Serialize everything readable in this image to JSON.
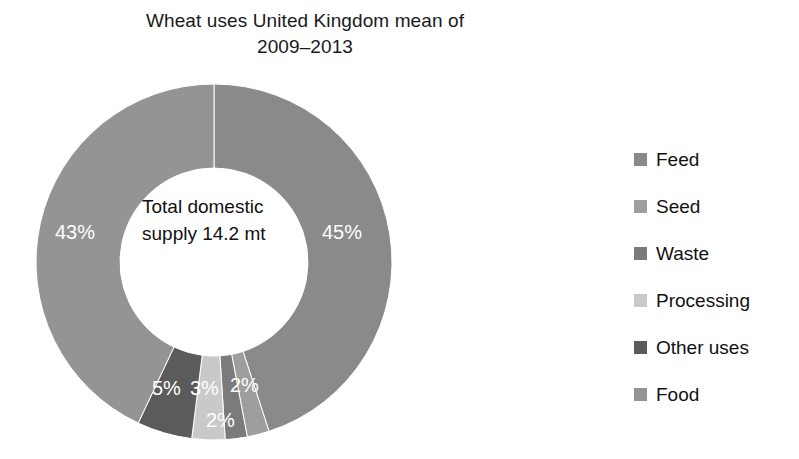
{
  "chart_data": {
    "type": "pie",
    "variant": "donut",
    "title": "Wheat uses United Kingdom mean of\n2009–2013",
    "xlabel": "",
    "ylabel": "",
    "center_label": "Total domestic supply 14.2 mt",
    "units": "percent",
    "total_label": "Total domestic supply 14.2 mt",
    "total_value": 14.2,
    "total_units": "mt",
    "legend_position": "right",
    "grid": false,
    "start_angle_deg": 0,
    "direction": "clockwise",
    "categories": [
      "Feed",
      "Seed",
      "Waste",
      "Processing",
      "Other uses",
      "Food"
    ],
    "values": [
      45,
      2,
      2,
      3,
      5,
      43
    ],
    "data_labels": [
      "45%",
      "2%",
      "2%",
      "3%",
      "5%",
      "43%"
    ],
    "colors": [
      "#8a8a8a",
      "#9e9e9e",
      "#7b7b7b",
      "#c9c9c9",
      "#5b5b5b",
      "#949494"
    ],
    "slices": [
      {
        "name": "Feed",
        "value": 45,
        "label": "45%",
        "color": "#8a8a8a"
      },
      {
        "name": "Seed",
        "value": 2,
        "label": "2%",
        "color": "#9e9e9e"
      },
      {
        "name": "Waste",
        "value": 2,
        "label": "2%",
        "color": "#7b7b7b"
      },
      {
        "name": "Processing",
        "value": 3,
        "label": "3%",
        "color": "#c9c9c9"
      },
      {
        "name": "Other uses",
        "value": 5,
        "label": "5%",
        "color": "#5b5b5b"
      },
      {
        "name": "Food",
        "value": 43,
        "label": "43%",
        "color": "#949494"
      }
    ]
  },
  "legend": {
    "items": [
      {
        "label": "Feed",
        "color": "#8a8a8a"
      },
      {
        "label": "Seed",
        "color": "#9e9e9e"
      },
      {
        "label": "Waste",
        "color": "#7b7b7b"
      },
      {
        "label": "Processing",
        "color": "#c9c9c9"
      },
      {
        "label": "Other uses",
        "color": "#5b5b5b"
      },
      {
        "label": "Food",
        "color": "#949494"
      }
    ]
  },
  "labels": {
    "food": "43%",
    "feed": "45%",
    "other_uses": "5%",
    "processing": "3%",
    "waste": "2%",
    "seed": "2%"
  }
}
